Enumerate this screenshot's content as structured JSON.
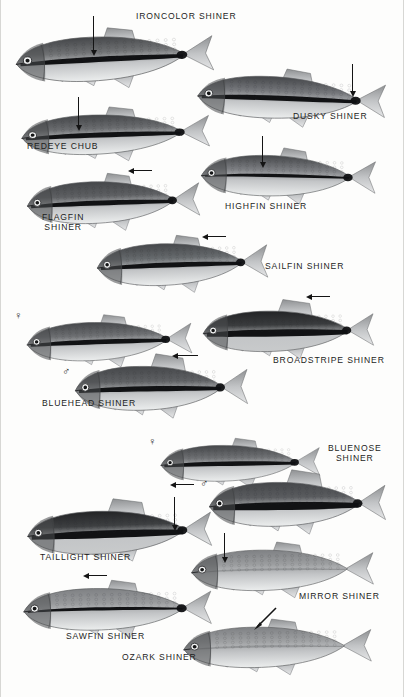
{
  "plate": {
    "title": "Shiner Minnows Identification Plate",
    "background_color": "#fdfdfc",
    "ink_color": "#1d1d1d",
    "width": 404,
    "height": 697
  },
  "captions": [
    {
      "id": "ironcolor",
      "text": "IRONCOLOR SHINER",
      "x": 136,
      "y": 11,
      "lines": 1
    },
    {
      "id": "dusky",
      "text": "DUSKY SHINER",
      "x": 293,
      "y": 111,
      "lines": 1
    },
    {
      "id": "redeye",
      "text": "REDEYE CHUB",
      "x": 27,
      "y": 141,
      "lines": 1
    },
    {
      "id": "flagfin",
      "text": "FLAGFIN\nSHINER",
      "x": 42,
      "y": 212,
      "lines": 2
    },
    {
      "id": "highfin",
      "text": "HIGHFIN SHINER",
      "x": 225,
      "y": 201,
      "lines": 1
    },
    {
      "id": "sailfin",
      "text": "SAILFIN SHINER",
      "x": 265,
      "y": 261,
      "lines": 1
    },
    {
      "id": "broadstripe",
      "text": "BROADSTRIPE SHINER",
      "x": 273,
      "y": 355,
      "lines": 1
    },
    {
      "id": "bluehead",
      "text": "BLUEHEAD SHINER",
      "x": 42,
      "y": 398,
      "lines": 1
    },
    {
      "id": "bluenose",
      "text": "BLUENOSE\nSHINER",
      "x": 328,
      "y": 443,
      "lines": 2
    },
    {
      "id": "taillight",
      "text": "TAILLIGHT SHINER",
      "x": 40,
      "y": 552,
      "lines": 1
    },
    {
      "id": "mirror",
      "text": "MIRROR SHINER",
      "x": 299,
      "y": 591,
      "lines": 1
    },
    {
      "id": "sawfin",
      "text": "SAWFIN SHINER",
      "x": 66,
      "y": 631,
      "lines": 1
    },
    {
      "id": "ozark",
      "text": "OZARK SHINER",
      "x": 122,
      "y": 652,
      "lines": 1
    }
  ],
  "sex_symbols": [
    {
      "id": "bluehead-female",
      "glyph": "♀",
      "x": 14,
      "y": 310,
      "species": "BLUEHEAD SHINER"
    },
    {
      "id": "bluehead-male",
      "glyph": "♂",
      "x": 62,
      "y": 366,
      "species": "BLUEHEAD SHINER"
    },
    {
      "id": "bluenose-female",
      "glyph": "♀",
      "x": 148,
      "y": 436,
      "species": "BLUENOSE SHINER"
    },
    {
      "id": "bluenose-male",
      "glyph": "♂",
      "x": 200,
      "y": 478,
      "species": "BLUENOSE SHINER"
    }
  ],
  "pointers": [
    {
      "id": "ironcolor-stripe",
      "type": "vertical",
      "x": 93,
      "y": 16,
      "length": 34,
      "points_to": "lateral stripe"
    },
    {
      "id": "dusky-caudal",
      "type": "vertical",
      "x": 352,
      "y": 64,
      "length": 27,
      "points_to": "caudal spot"
    },
    {
      "id": "redeye-stripe",
      "type": "vertical",
      "x": 78,
      "y": 97,
      "length": 28,
      "points_to": "lateral stripe"
    },
    {
      "id": "highfin-dorsal",
      "type": "vertical",
      "x": 262,
      "y": 136,
      "length": 26,
      "points_to": "dorsal fin"
    },
    {
      "id": "flagfin-dorsal",
      "type": "horizontal",
      "x": 134,
      "y": 170,
      "length": 18,
      "points_to": "dorsal fin"
    },
    {
      "id": "sailfin-dorsal",
      "type": "horizontal",
      "x": 208,
      "y": 236,
      "length": 18,
      "points_to": "dorsal fin"
    },
    {
      "id": "broadstripe-dorsal",
      "type": "horizontal",
      "x": 312,
      "y": 296,
      "length": 18,
      "points_to": "dorsal fin"
    },
    {
      "id": "bluehead-dorsal",
      "type": "horizontal",
      "x": 178,
      "y": 355,
      "length": 20,
      "points_to": "enlarged dorsal fin"
    },
    {
      "id": "bluenose-snout",
      "type": "horizontal",
      "x": 176,
      "y": 484,
      "length": 18,
      "points_to": "blue snout"
    },
    {
      "id": "taillight-spot",
      "type": "vertical",
      "x": 174,
      "y": 497,
      "length": 28,
      "points_to": "caudal spot"
    },
    {
      "id": "mirror-scales",
      "type": "vertical",
      "x": 224,
      "y": 533,
      "length": 24,
      "points_to": "scale pattern"
    },
    {
      "id": "sawfin-dorsal",
      "type": "horizontal",
      "x": 89,
      "y": 575,
      "length": 18,
      "points_to": "dorsal fin"
    },
    {
      "id": "ozark-dorsal",
      "type": "diagonal",
      "x": 252,
      "y": 607,
      "length": 22,
      "points_to": "dorsal fin"
    }
  ],
  "fish": [
    {
      "id": "ironcolor",
      "name": "IRONCOLOR SHINER",
      "x": 10,
      "y": 20,
      "w": 206,
      "h": 76,
      "rotate": -3,
      "body": "dark-stripe",
      "stripe": "heavy-black",
      "tone": "#6f7173"
    },
    {
      "id": "dusky",
      "name": "DUSKY SHINER",
      "x": 192,
      "y": 62,
      "w": 196,
      "h": 72,
      "rotate": 2,
      "body": "dark-stripe",
      "stripe": "heavy-black",
      "tone": "#74767a"
    },
    {
      "id": "redeye",
      "name": "REDEYE CHUB",
      "x": 16,
      "y": 100,
      "w": 196,
      "h": 68,
      "rotate": -2,
      "body": "dark-stripe",
      "stripe": "heavy-black",
      "tone": "#6a6c6f"
    },
    {
      "id": "highfin",
      "name": "HIGHFIN SHINER",
      "x": 196,
      "y": 141,
      "w": 182,
      "h": 70,
      "rotate": 1,
      "body": "dark-stripe",
      "stripe": "medium",
      "tone": "#7a7c80"
    },
    {
      "id": "flagfin",
      "name": "FLAGFIN SHINER",
      "x": 22,
      "y": 166,
      "w": 180,
      "h": 72,
      "rotate": -2,
      "body": "dark-stripe",
      "stripe": "heavy-black",
      "tone": "#5e6063"
    },
    {
      "id": "sailfin",
      "name": "SAILFIN SHINER",
      "x": 92,
      "y": 228,
      "w": 178,
      "h": 72,
      "rotate": -2,
      "body": "dark-stripe",
      "stripe": "heavy-black",
      "tone": "#666a6d"
    },
    {
      "id": "broadstripe",
      "name": "BROADSTRIPE SHINER",
      "x": 198,
      "y": 296,
      "w": 178,
      "h": 70,
      "rotate": -1,
      "body": "very-dark",
      "stripe": "broad-black",
      "tone": "#3a3c3e"
    },
    {
      "id": "bluehead-f",
      "name": "BLUEHEAD SHINER",
      "x": 22,
      "y": 308,
      "w": 172,
      "h": 66,
      "rotate": -2,
      "body": "dark-stripe",
      "stripe": "heavy-black",
      "tone": "#6d6f72"
    },
    {
      "id": "bluehead-m",
      "name": "BLUEHEAD SHINER",
      "x": 70,
      "y": 350,
      "w": 180,
      "h": 76,
      "rotate": -1,
      "body": "dark-stripe",
      "stripe": "heavy-black",
      "tone": "#5f6164"
    },
    {
      "id": "bluenose-f",
      "name": "BLUENOSE SHINER",
      "x": 156,
      "y": 432,
      "w": 166,
      "h": 62,
      "rotate": -1,
      "body": "dark-stripe",
      "stripe": "heavy-black",
      "tone": "#6e7073"
    },
    {
      "id": "bluenose-m",
      "name": "BLUENOSE SHINER",
      "x": 204,
      "y": 466,
      "w": 184,
      "h": 76,
      "rotate": -1,
      "body": "dark-stripe",
      "stripe": "broad-black",
      "tone": "#5a5c5f"
    },
    {
      "id": "taillight",
      "name": "TAILLIGHT SHINER",
      "x": 22,
      "y": 495,
      "w": 192,
      "h": 74,
      "rotate": -2,
      "body": "very-dark",
      "stripe": "broad-black",
      "tone": "#3e4042"
    },
    {
      "id": "mirror",
      "name": "MIRROR SHINER",
      "x": 186,
      "y": 535,
      "w": 190,
      "h": 70,
      "rotate": -1,
      "body": "pale",
      "stripe": "faint",
      "tone": "#9a9c9e"
    },
    {
      "id": "sawfin",
      "name": "SAWFIN SHINER",
      "x": 18,
      "y": 573,
      "w": 196,
      "h": 72,
      "rotate": -1,
      "body": "pale",
      "stripe": "medium",
      "tone": "#97999b"
    },
    {
      "id": "ozark",
      "name": "OZARK SHINER",
      "x": 178,
      "y": 612,
      "w": 196,
      "h": 70,
      "rotate": -1,
      "body": "pale",
      "stripe": "faint",
      "tone": "#9d9fa1"
    }
  ]
}
